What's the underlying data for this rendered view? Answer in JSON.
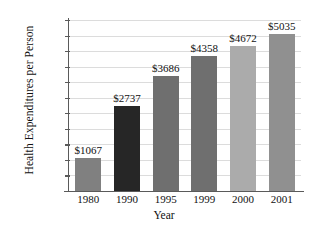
{
  "chart_data": {
    "type": "bar",
    "title": "",
    "xlabel": "Year",
    "ylabel": "Health Expenditures per Person",
    "categories": [
      "1980",
      "1990",
      "1995",
      "1999",
      "2000",
      "2001"
    ],
    "values": [
      1067,
      2737,
      3686,
      4358,
      4672,
      5035
    ],
    "value_labels": [
      "$1067",
      "$2737",
      "$3686",
      "$4358",
      "$4672",
      "$5035"
    ],
    "bar_colors": [
      "#808080",
      "#262626",
      "#6f6f6f",
      "#6f6f6f",
      "#ababab",
      "#909090"
    ],
    "ylim": [
      0,
      5500
    ],
    "ytick_values": [
      500,
      1000,
      1500,
      2000,
      2500,
      3000,
      3500,
      4000,
      4500,
      5000,
      5500
    ],
    "ytick_labels": [
      "$500",
      "$1000",
      "$1500",
      "$2000",
      "$2500",
      "$3000",
      "$3500",
      "$4000",
      "$4500",
      "$5000",
      "$5500"
    ],
    "grid": true,
    "grid_color": "#dcdcdc",
    "axis_color": "#5a5a5a",
    "legend": null,
    "background": "#ffffff"
  }
}
